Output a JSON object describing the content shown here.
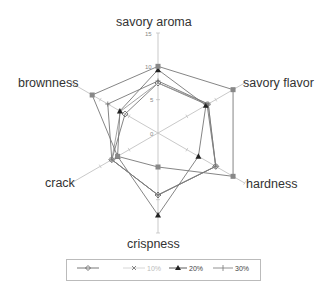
{
  "chart_data": {
    "type": "radar",
    "title": "",
    "axes": [
      "savory aroma",
      "savory flavor",
      "hardness",
      "crispness",
      "crack",
      "brownness"
    ],
    "tick_labels": [
      "0",
      "5",
      "10",
      "15"
    ],
    "rlim": [
      0,
      15
    ],
    "grid": true,
    "legend_position": "bottom",
    "series": [
      {
        "name": "",
        "marker": "diamond",
        "color": "#555555",
        "values": [
          7.5,
          8.5,
          10,
          9.3,
          8,
          5.7
        ]
      },
      {
        "name": "10%",
        "marker": "x",
        "color": "#aaaaaa",
        "values": [
          7.5,
          8.7,
          10,
          9.3,
          8,
          6.5
        ]
      },
      {
        "name": "20%",
        "marker": "triangle",
        "color": "#222222",
        "values": [
          9.5,
          8.3,
          7,
          12.3,
          7,
          6.6
        ]
      },
      {
        "name": "30%",
        "marker": "plus",
        "color": "#777777",
        "values": [
          7.8,
          8.7,
          10,
          9.3,
          8,
          8.7
        ]
      },
      {
        "name": "",
        "marker": "square",
        "color": "#888888",
        "values": [
          10,
          13,
          13,
          5.1,
          7,
          11.4
        ],
        "in_legend": false
      }
    ]
  },
  "labels": {
    "savory_aroma": "savory aroma",
    "savory_flavor": "savory flavor",
    "hardness": "hardness",
    "crispness": "crispness",
    "crack": "crack",
    "brownness": "brownness",
    "tick0": "0",
    "tick5": "5",
    "tick10": "10",
    "tick15": "15"
  },
  "legend": {
    "item0": "",
    "item1": "10%",
    "item2": "20%",
    "item3": "30%"
  }
}
